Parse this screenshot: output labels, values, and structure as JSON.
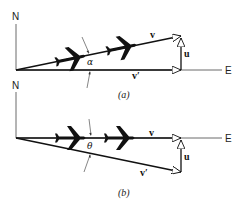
{
  "diagrams": [
    {
      "caption": "(a)",
      "north_label": "N",
      "east_label": "E",
      "vector_v_label": "v",
      "vector_v_prime_label": "v′",
      "vector_u_label": "u",
      "angle_label": "α"
    },
    {
      "caption": "(b)",
      "north_label": "N",
      "east_label": "E",
      "vector_v_label": "v",
      "vector_v_prime_label": "v′",
      "vector_u_label": "u",
      "angle_label": "θ"
    }
  ],
  "colors": {
    "line": "#111111",
    "axis": "#444444",
    "background": "#ffffff"
  }
}
